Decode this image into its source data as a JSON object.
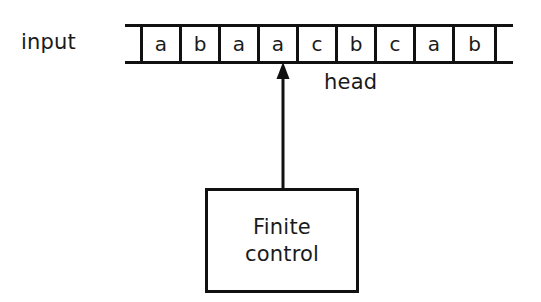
{
  "figure": {
    "background_color": "#ffffff",
    "line_color": "#111111",
    "text_color": "#1a1a1a"
  },
  "input_label": "input",
  "tape": {
    "cells": [
      "a",
      "b",
      "a",
      "a",
      "c",
      "b",
      "c",
      "a",
      "b"
    ],
    "left_end_blank": "",
    "right_end_blank": ""
  },
  "head": {
    "label": "head",
    "points_to_cell_index": 3,
    "points_to_symbol": "a",
    "direction": "up"
  },
  "control": {
    "line1": "Finite",
    "line2": "control"
  }
}
